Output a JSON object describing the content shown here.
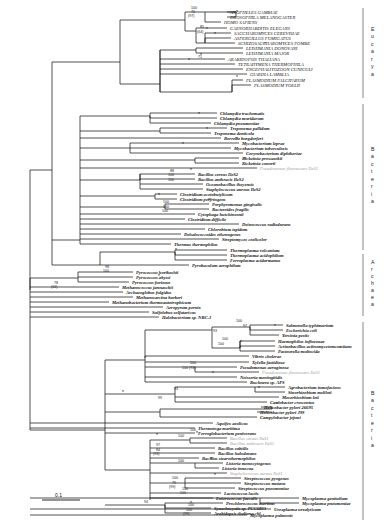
{
  "figure": {
    "type": "phylogram",
    "scale_bar": {
      "label": "0.1",
      "length_px": 38
    },
    "node_support_note": "*",
    "domains": [
      {
        "name": "Eucarya",
        "letters": [
          "E",
          "u",
          "c",
          "a",
          "r",
          "y",
          "a"
        ],
        "y_top": 8,
        "y_bottom": 98
      },
      {
        "name": "Bacteria",
        "letters": [
          "B",
          "a",
          "c",
          "t",
          "e",
          "r",
          "i",
          "a"
        ],
        "y_top": 104,
        "y_bottom": 250
      },
      {
        "name": "Archaea",
        "letters": [
          "A",
          "r",
          "c",
          "h",
          "a",
          "e",
          "a"
        ],
        "y_top": 254,
        "y_bottom": 316
      },
      {
        "name": "Bacteria2",
        "letters": [
          "B",
          "a",
          "c",
          "t",
          "e",
          "r",
          "i",
          "a"
        ],
        "y_top": 322,
        "y_bottom": 520
      }
    ],
    "taxa": [
      {
        "id": "t1",
        "label": "ANOPHELES GAMBIAE",
        "y": 12,
        "x": 228,
        "style": "caps"
      },
      {
        "id": "t2",
        "label": "DROSOPHILA MELANOGASTER",
        "y": 17,
        "x": 228,
        "style": "caps"
      },
      {
        "id": "t3",
        "label": "HOMO SAPIENS",
        "y": 22,
        "x": 222,
        "style": "caps"
      },
      {
        "id": "t4",
        "label": "CAENORHABDITIS ELEGANS",
        "y": 28,
        "x": 228,
        "style": "caps"
      },
      {
        "id": "t5",
        "label": "SACCHAROMYCES CEREVISIAE",
        "y": 33,
        "x": 232,
        "style": "caps"
      },
      {
        "id": "t6",
        "label": "ASPERGILLUS FUMIGATUS",
        "y": 38,
        "x": 232,
        "style": "caps"
      },
      {
        "id": "t7",
        "label": "SCHIZOSACCHAROMYCES POMBE",
        "y": 43,
        "x": 236,
        "style": "caps"
      },
      {
        "id": "t8",
        "label": "LEISHMANIA DONOVANI",
        "y": 48,
        "x": 244,
        "style": "caps"
      },
      {
        "id": "t9",
        "label": "LEISHMANIA MAJOR",
        "y": 53,
        "x": 244,
        "style": "caps"
      },
      {
        "id": "t10",
        "label": "ARABIDOPSIS THALIANA",
        "y": 59,
        "x": 226,
        "style": "caps"
      },
      {
        "id": "t11",
        "label": "TETRAHYMENA THERMOPHILA",
        "y": 64,
        "x": 236,
        "style": "caps"
      },
      {
        "id": "t12",
        "label": "ENCEPHALITOZOON CUNICULI",
        "y": 69,
        "x": 244,
        "style": "caps"
      },
      {
        "id": "t13",
        "label": "GIARDIA LAMBLIA",
        "y": 74,
        "x": 248,
        "style": "caps"
      },
      {
        "id": "t14",
        "label": "PLASMODIUM FALCIPARUM",
        "y": 80,
        "x": 244,
        "style": "caps"
      },
      {
        "id": "t15",
        "label": "PLASMODIUM YOELII",
        "y": 85,
        "x": 252,
        "style": "caps"
      },
      {
        "id": "b1",
        "label": "Chlamydia trachomatis",
        "y": 113,
        "x": 218,
        "style": "bold"
      },
      {
        "id": "b2",
        "label": "Chlamydia muridarum",
        "y": 118,
        "x": 218,
        "style": "bold"
      },
      {
        "id": "b3",
        "label": "Chlamydia pneumoniae",
        "y": 123,
        "x": 212,
        "style": "bold"
      },
      {
        "id": "b4",
        "label": "Treponema pallidum",
        "y": 128,
        "x": 228,
        "style": "bold"
      },
      {
        "id": "b5",
        "label": "Treponema denticola",
        "y": 133,
        "x": 212,
        "style": "bold"
      },
      {
        "id": "b6",
        "label": "Borrelia burgdorferi",
        "y": 138,
        "x": 222,
        "style": "bold"
      },
      {
        "id": "b7",
        "label": "Mycobacterium leprae",
        "y": 143,
        "x": 240,
        "style": "bold"
      },
      {
        "id": "b8",
        "label": "Mycobacterium tuberculosis",
        "y": 148,
        "x": 232,
        "style": "bold"
      },
      {
        "id": "b9",
        "label": "Corynebacterium diphtheriae",
        "y": 153,
        "x": 244,
        "style": "bold"
      },
      {
        "id": "b10",
        "label": "Rickettsia prowazekii",
        "y": 158,
        "x": 240,
        "style": "bold"
      },
      {
        "id": "b11",
        "label": "Rickettsia conorii",
        "y": 163,
        "x": 240,
        "style": "bold"
      },
      {
        "id": "b12",
        "label": "Pseudomonas fluorescens IleS2",
        "y": 168,
        "x": 258,
        "style": "gray"
      },
      {
        "id": "b13",
        "label": "Bacillus cereus IleS2",
        "y": 174,
        "x": 196,
        "style": "bold"
      },
      {
        "id": "b14",
        "label": "Bacillus anthracis IleS2",
        "y": 179,
        "x": 196,
        "style": "bold"
      },
      {
        "id": "b15",
        "label": "Oceanobacillus iheyensis",
        "y": 184,
        "x": 204,
        "style": "bold"
      },
      {
        "id": "b16",
        "label": "Staphylococcus aureus IleS2",
        "y": 189,
        "x": 204,
        "style": "bold"
      },
      {
        "id": "b17",
        "label": "Clostridium acetobutylicum",
        "y": 194,
        "x": 178,
        "style": "bold"
      },
      {
        "id": "b18",
        "label": "Clostridium perfringens",
        "y": 199,
        "x": 178,
        "style": "bold"
      },
      {
        "id": "b19",
        "label": "Porphyromonas gingivalis",
        "y": 204,
        "x": 210,
        "style": "bold"
      },
      {
        "id": "b20",
        "label": "Bacteroides fragilis",
        "y": 209,
        "x": 210,
        "style": "bold"
      },
      {
        "id": "b21",
        "label": "Cytophaga hutchinsonii",
        "y": 214,
        "x": 196,
        "style": "bold"
      },
      {
        "id": "b22",
        "label": "Clostridium difficile",
        "y": 219,
        "x": 186,
        "style": "bold"
      },
      {
        "id": "b23",
        "label": "Deinococcus radiodurans",
        "y": 224,
        "x": 240,
        "style": "bold"
      },
      {
        "id": "b24",
        "label": "Chlorobium tepidum",
        "y": 229,
        "x": 206,
        "style": "bold"
      },
      {
        "id": "b25",
        "label": "Dehalococcoides ethenogenes",
        "y": 234,
        "x": 182,
        "style": "bold"
      },
      {
        "id": "b26",
        "label": "Streptomyces coelicolor",
        "y": 239,
        "x": 220,
        "style": "bold"
      },
      {
        "id": "b27",
        "label": "Thermus thermophilus",
        "y": 244,
        "x": 172,
        "style": "bold"
      },
      {
        "id": "a1",
        "label": "Thermoplasma volcanium",
        "y": 250,
        "x": 228,
        "style": "bold"
      },
      {
        "id": "a2",
        "label": "Thermoplasma acidophilum",
        "y": 255,
        "x": 228,
        "style": "bold"
      },
      {
        "id": "a3",
        "label": "Ferroplasma acidarmanus",
        "y": 260,
        "x": 228,
        "style": "bold"
      },
      {
        "id": "a4",
        "label": "Pyrobaculum aerophilum",
        "y": 265,
        "x": 190,
        "style": "bold"
      },
      {
        "id": "a5",
        "label": "Pyrococcus horikoshii",
        "y": 272,
        "x": 134,
        "style": "bold"
      },
      {
        "id": "a6",
        "label": "Pyrococcus abyssi",
        "y": 277,
        "x": 134,
        "style": "bold"
      },
      {
        "id": "a7",
        "label": "Pyrococcus furiosus",
        "y": 282,
        "x": 130,
        "style": "bold"
      },
      {
        "id": "a8",
        "label": "Methanococcus jannaschii",
        "y": 287,
        "x": 120,
        "style": "bold"
      },
      {
        "id": "a9",
        "label": "Archaeoglobus fulgidus",
        "y": 292,
        "x": 124,
        "style": "bold"
      },
      {
        "id": "a10",
        "label": "Methanosarcina barkeri",
        "y": 297,
        "x": 134,
        "style": "bold"
      },
      {
        "id": "a11",
        "label": "Methanobacterium thermoautotrophicum",
        "y": 302,
        "x": 110,
        "style": "bold"
      },
      {
        "id": "a12",
        "label": "Aeropyrum pernix",
        "y": 307,
        "x": 164,
        "style": "bold"
      },
      {
        "id": "a13",
        "label": "Sulfolobus solfataricus",
        "y": 312,
        "x": 150,
        "style": "bold"
      },
      {
        "id": "a14",
        "label": "Halobacterium sp. NRC-1",
        "y": 317,
        "x": 160,
        "style": "bold"
      },
      {
        "id": "c1",
        "label": "Salmonella typhimurium",
        "y": 325,
        "x": 284,
        "style": "bold"
      },
      {
        "id": "c2",
        "label": "Escherichia coli",
        "y": 330,
        "x": 284,
        "style": "bold"
      },
      {
        "id": "c3",
        "label": "Yersinia pestis",
        "y": 335,
        "x": 280,
        "style": "bold"
      },
      {
        "id": "c4",
        "label": "Haemophilus influenzae",
        "y": 341,
        "x": 276,
        "style": "bold"
      },
      {
        "id": "c5",
        "label": "Actinobacillus actinomycetemcomitans",
        "y": 346,
        "x": 276,
        "style": "bold"
      },
      {
        "id": "c6",
        "label": "Pasteurella multocida",
        "y": 351,
        "x": 276,
        "style": "bold"
      },
      {
        "id": "c7",
        "label": "Vibrio cholerae",
        "y": 356,
        "x": 250,
        "style": "bold"
      },
      {
        "id": "c8",
        "label": "Xylella fastidiosa",
        "y": 362,
        "x": 250,
        "style": "bold"
      },
      {
        "id": "c9",
        "label": "Pseudomonas aeruginosa",
        "y": 367,
        "x": 238,
        "style": "bold"
      },
      {
        "id": "c10",
        "label": "Pseudomonas fluorescens IleS1",
        "y": 372,
        "x": 260,
        "style": "gray"
      },
      {
        "id": "c11",
        "label": "Neisseria meningitidis",
        "y": 377,
        "x": 238,
        "style": "bold"
      },
      {
        "id": "c12",
        "label": "Buchnera sp. APS",
        "y": 382,
        "x": 248,
        "style": "bold"
      },
      {
        "id": "c13",
        "label": "Agrobacterium tumefaciens",
        "y": 387,
        "x": 286,
        "style": "bold"
      },
      {
        "id": "c14",
        "label": "Sinorhizobium meliloti",
        "y": 392,
        "x": 286,
        "style": "bold"
      },
      {
        "id": "c15",
        "label": "Mesorhizobium loti",
        "y": 397,
        "x": 280,
        "style": "bold"
      },
      {
        "id": "c16",
        "label": "Caulobacter crescentus",
        "y": 402,
        "x": 268,
        "style": "bold"
      },
      {
        "id": "c17",
        "label": "Helicobacter pylori 26695",
        "y": 407,
        "x": 262,
        "style": "bold"
      },
      {
        "id": "c18",
        "label": "Helicobacter pylori J99",
        "y": 412,
        "x": 258,
        "style": "bold"
      },
      {
        "id": "c19",
        "label": "Campylobacter jejuni",
        "y": 417,
        "x": 258,
        "style": "bold"
      },
      {
        "id": "c20",
        "label": "Aquifex aeolicus",
        "y": 423,
        "x": 214,
        "style": "bold"
      },
      {
        "id": "c21",
        "label": "Thermotoga maritima",
        "y": 428,
        "x": 196,
        "style": "bold"
      },
      {
        "id": "c22",
        "label": "Ferroglobacterium penivorans",
        "y": 433,
        "x": 196,
        "style": "bold"
      },
      {
        "id": "c23",
        "label": "Bacillus cereus IleS1",
        "y": 438,
        "x": 228,
        "style": "gray"
      },
      {
        "id": "c24",
        "label": "Bacillus anthracis IleS1",
        "y": 443,
        "x": 228,
        "style": "gray"
      },
      {
        "id": "c25",
        "label": "Bacillus subtilis",
        "y": 448,
        "x": 216,
        "style": "bold"
      },
      {
        "id": "c26",
        "label": "Bacillus halodurans",
        "y": 453,
        "x": 216,
        "style": "bold"
      },
      {
        "id": "c27",
        "label": "Bacillus stearothermophilus",
        "y": 458,
        "x": 200,
        "style": "bold"
      },
      {
        "id": "c28",
        "label": "Listeria monocytogenes",
        "y": 463,
        "x": 224,
        "style": "bold"
      },
      {
        "id": "c29",
        "label": "Listeria innocua",
        "y": 468,
        "x": 220,
        "style": "bold"
      },
      {
        "id": "c30",
        "label": "Staphylococcus aureus IleS1",
        "y": 473,
        "x": 228,
        "style": "gray"
      },
      {
        "id": "c31",
        "label": "Streptococcus pyogenes",
        "y": 478,
        "x": 242,
        "style": "bold"
      },
      {
        "id": "c32",
        "label": "Streptococcus mutans",
        "y": 483,
        "x": 242,
        "style": "bold"
      },
      {
        "id": "c33",
        "label": "Streptococcus pneumoniae",
        "y": 488,
        "x": 236,
        "style": "bold"
      },
      {
        "id": "c34",
        "label": "Lactococcus lactis",
        "y": 493,
        "x": 222,
        "style": "bold"
      },
      {
        "id": "c35",
        "label": "Enterococcus faecalis",
        "y": 498,
        "x": 214,
        "style": "bold"
      },
      {
        "id": "c36",
        "label": "Prochlorococcus marinus",
        "y": 503,
        "x": 224,
        "style": "bold"
      },
      {
        "id": "c37",
        "label": "Synechocystis sp. PCC6803",
        "y": 508,
        "x": 212,
        "style": "bold"
      },
      {
        "id": "c38",
        "label": "Arabidopsis thaliana chl.",
        "y": 513,
        "x": 212,
        "style": "bold"
      },
      {
        "id": "c39",
        "label": "Mycoplasma genitalium",
        "y": 498,
        "x": 300,
        "style": "bold"
      },
      {
        "id": "c40",
        "label": "Mycoplasma pneumoniae",
        "y": 503,
        "x": 300,
        "style": "bold"
      },
      {
        "id": "c41",
        "label": "Ureaplasma urealyticum",
        "y": 509,
        "x": 272,
        "style": "bold"
      },
      {
        "id": "c42",
        "label": "Mycoplasma pulmonis",
        "y": 515,
        "x": 248,
        "style": "bold"
      }
    ],
    "bootstrap_labels": [
      {
        "text": "100",
        "x": 191,
        "y": 9
      },
      {
        "text": "70",
        "x": 191,
        "y": 13
      },
      {
        "text": "(97)",
        "x": 188,
        "y": 17
      },
      {
        "text": "85",
        "x": 200,
        "y": 28
      },
      {
        "text": "(64)",
        "x": 197,
        "y": 33
      },
      {
        "text": "71",
        "x": 198,
        "y": 58
      },
      {
        "text": "88",
        "x": 170,
        "y": 172
      },
      {
        "text": "100",
        "x": 168,
        "y": 176
      },
      {
        "text": "100",
        "x": 168,
        "y": 181
      },
      {
        "text": "100",
        "x": 163,
        "y": 203
      },
      {
        "text": "100",
        "x": 163,
        "y": 208
      },
      {
        "text": "100",
        "x": 162,
        "y": 212
      },
      {
        "text": "98",
        "x": 105,
        "y": 268
      },
      {
        "text": "100",
        "x": 103,
        "y": 272
      },
      {
        "text": "78",
        "x": 54,
        "y": 284
      },
      {
        "text": "(63)",
        "x": 51,
        "y": 288
      },
      {
        "text": "100",
        "x": 236,
        "y": 322
      },
      {
        "text": "97",
        "x": 243,
        "y": 327
      },
      {
        "text": "93",
        "x": 213,
        "y": 332
      },
      {
        "text": "100",
        "x": 222,
        "y": 340
      },
      {
        "text": "100",
        "x": 218,
        "y": 345
      },
      {
        "text": "100",
        "x": 190,
        "y": 364
      },
      {
        "text": "100 (93)",
        "x": 182,
        "y": 369
      },
      {
        "text": "93",
        "x": 174,
        "y": 390
      },
      {
        "text": "99",
        "x": 158,
        "y": 399
      },
      {
        "text": "100",
        "x": 190,
        "y": 431
      },
      {
        "text": "100",
        "x": 178,
        "y": 437
      },
      {
        "text": "97",
        "x": 156,
        "y": 446
      },
      {
        "text": "84",
        "x": 156,
        "y": 451
      },
      {
        "text": "(93)",
        "x": 153,
        "y": 455
      },
      {
        "text": "100",
        "x": 178,
        "y": 462
      },
      {
        "text": "100",
        "x": 172,
        "y": 479
      },
      {
        "text": "79",
        "x": 172,
        "y": 484
      },
      {
        "text": "(99)",
        "x": 169,
        "y": 488
      },
      {
        "text": "100",
        "x": 182,
        "y": 490
      },
      {
        "text": "100",
        "x": 180,
        "y": 494
      },
      {
        "text": "94",
        "x": 144,
        "y": 503
      },
      {
        "text": "100",
        "x": 188,
        "y": 506
      },
      {
        "text": "100",
        "x": 186,
        "y": 511
      },
      {
        "text": "(99)",
        "x": 183,
        "y": 515
      }
    ],
    "starred_nodes": [
      {
        "x": 236,
        "y": 14
      },
      {
        "x": 206,
        "y": 31
      },
      {
        "x": 214,
        "y": 36
      },
      {
        "x": 264,
        "y": 46
      },
      {
        "x": 200,
        "y": 57
      },
      {
        "x": 236,
        "y": 79
      },
      {
        "x": 188,
        "y": 62
      },
      {
        "x": 198,
        "y": 116
      },
      {
        "x": 206,
        "y": 131
      },
      {
        "x": 182,
        "y": 146
      },
      {
        "x": 236,
        "y": 141
      },
      {
        "x": 244,
        "y": 161
      },
      {
        "x": 190,
        "y": 172
      },
      {
        "x": 158,
        "y": 197
      },
      {
        "x": 208,
        "y": 202
      },
      {
        "x": 175,
        "y": 252
      },
      {
        "x": 158,
        "y": 278
      },
      {
        "x": 274,
        "y": 328
      },
      {
        "x": 240,
        "y": 344
      },
      {
        "x": 212,
        "y": 375
      },
      {
        "x": 258,
        "y": 390
      },
      {
        "x": 276,
        "y": 406
      },
      {
        "x": 196,
        "y": 435
      },
      {
        "x": 210,
        "y": 461
      },
      {
        "x": 214,
        "y": 477
      },
      {
        "x": 190,
        "y": 505
      },
      {
        "x": 156,
        "y": 437
      },
      {
        "x": 122,
        "y": 394
      },
      {
        "x": 144,
        "y": 360
      }
    ]
  }
}
